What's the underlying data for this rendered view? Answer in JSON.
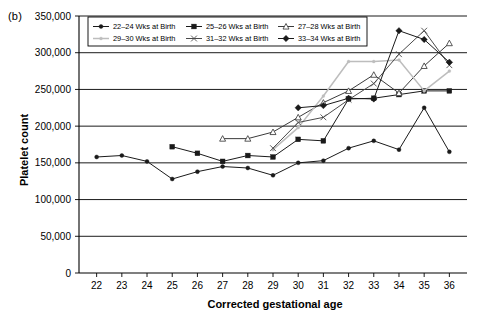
{
  "figure": {
    "panel_label": "(b)",
    "width": 488,
    "height": 318,
    "background": "#ffffff"
  },
  "chart_data": {
    "type": "line",
    "title": "",
    "subtitle": "",
    "xlabel": "Corrected gestational age",
    "ylabel": "Platelet count",
    "xlim": [
      21.3,
      36.7
    ],
    "ylim": [
      0,
      350000
    ],
    "xticks": [
      22,
      23,
      24,
      25,
      26,
      27,
      28,
      29,
      30,
      31,
      32,
      33,
      34,
      35,
      36
    ],
    "xtick_labels": [
      "22",
      "23",
      "24",
      "25",
      "26",
      "27",
      "28",
      "29",
      "30",
      "31",
      "32",
      "33",
      "34",
      "35",
      "36"
    ],
    "yticks": [
      0,
      50000,
      100000,
      150000,
      200000,
      250000,
      300000,
      350000
    ],
    "ytick_labels": [
      "0",
      "50,000",
      "100,000",
      "150,000",
      "200,000",
      "250,000",
      "300,000",
      "350,000"
    ],
    "grid": "horizontal",
    "legend_position": "top-inside",
    "series": [
      {
        "name": "22–24 Wks at Birth",
        "marker": "circle-small",
        "color": "#1a1a1a",
        "x": [
          22,
          23,
          24,
          25,
          26,
          27,
          28,
          29,
          30,
          31,
          32,
          33,
          34,
          35,
          36
        ],
        "values": [
          158000,
          160000,
          152000,
          128000,
          138000,
          145000,
          143000,
          133000,
          150000,
          153000,
          170000,
          180000,
          168000,
          225000,
          165000
        ]
      },
      {
        "name": "25–26 Wks at Birth",
        "marker": "square",
        "color": "#1a1a1a",
        "x": [
          25,
          26,
          27,
          28,
          29,
          30,
          31,
          32,
          33,
          34,
          35,
          36
        ],
        "values": [
          172000,
          163000,
          152000,
          160000,
          158000,
          182000,
          180000,
          237000,
          238000,
          243000,
          248000,
          248000
        ]
      },
      {
        "name": "27–28 Wks at Birth",
        "marker": "triangle",
        "color": "#3b3b3b",
        "x": [
          27,
          28,
          29,
          30,
          31,
          32,
          33,
          34,
          35,
          36
        ],
        "values": [
          183000,
          183000,
          192000,
          212000,
          232000,
          248000,
          270000,
          245000,
          282000,
          313000
        ]
      },
      {
        "name": "29–30 Wks at Birth",
        "marker": "none-light",
        "color": "#bdbdbd",
        "x": [
          29,
          30,
          31,
          32,
          33,
          34,
          35,
          36
        ],
        "values": [
          168000,
          198000,
          241000,
          288000,
          288000,
          290000,
          248000,
          275000
        ]
      },
      {
        "name": "31–32 Wks at Birth",
        "marker": "cross",
        "color": "#4a4a4a",
        "x": [
          29,
          30,
          31,
          32,
          33,
          34,
          35,
          36
        ],
        "values": [
          170000,
          205000,
          212000,
          236000,
          258000,
          298000,
          330000,
          283000
        ]
      },
      {
        "name": "33–34 Wks at Birth",
        "marker": "diamond-filled",
        "color": "#1a1a1a",
        "x": [
          30,
          31,
          32,
          33,
          34,
          35,
          36
        ],
        "values": [
          225000,
          228000,
          238000,
          237000,
          330000,
          318000,
          287000
        ]
      }
    ],
    "annotations": []
  },
  "legend": {
    "entries": [
      {
        "label": "22–24 Wks at Birth"
      },
      {
        "label": "25–26 Wks at Birth"
      },
      {
        "label": "27–28 Wks at Birth"
      },
      {
        "label": "29–30 Wks at Birth"
      },
      {
        "label": "31–32 Wks at Birth"
      },
      {
        "label": "33–34 Wks at Birth"
      }
    ]
  }
}
